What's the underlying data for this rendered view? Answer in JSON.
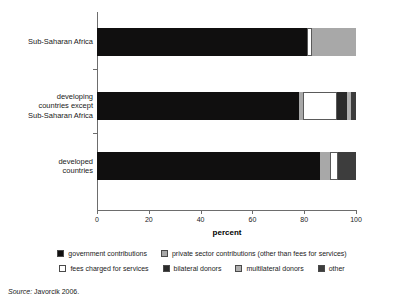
{
  "chart_data": {
    "type": "bar",
    "orientation": "horizontal",
    "stacked": true,
    "title": "",
    "xlabel": "percent",
    "ylabel": "",
    "xlim": [
      0,
      100
    ],
    "xticks": [
      0,
      20,
      40,
      60,
      80,
      100
    ],
    "xtick_labels": [
      "0",
      "20",
      "40",
      "60",
      "80",
      "100"
    ],
    "grid": false,
    "legend_position": "bottom",
    "categories": [
      "Sub-Saharan Africa",
      "developing countries except Sub-Saharan Africa",
      "developed countries"
    ],
    "category_label_lines": [
      [
        "Sub-Saharan Africa"
      ],
      [
        "developing",
        "countries except",
        "Sub-Saharan Africa"
      ],
      [
        "developed",
        "countries"
      ]
    ],
    "series": [
      {
        "name": "government contributions",
        "color": "#100f0f",
        "values": [
          81,
          78,
          86
        ]
      },
      {
        "name": "private sector contributions (other than fees for services)",
        "color": "#a8a8a8",
        "values": [
          17,
          1.5,
          4
        ]
      },
      {
        "name": "fees charged for services",
        "color": "#ffffff",
        "values": [
          2,
          13,
          3
        ]
      },
      {
        "name": "bilateral donors",
        "color": "#2b2b2b",
        "values": [
          0,
          4,
          7
        ]
      },
      {
        "name": "multilateral donors",
        "color": "#b0b0b0",
        "values": [
          0,
          1.5,
          0
        ]
      },
      {
        "name": "other",
        "color": "#3d3d3d",
        "values": [
          0,
          2,
          0
        ]
      }
    ],
    "bars": [
      {
        "category": "Sub-Saharan Africa",
        "segments": [
          {
            "name": "government contributions",
            "value": 81,
            "color": "#100f0f"
          },
          {
            "name": "fees charged for services",
            "value": 2,
            "color": "#ffffff"
          },
          {
            "name": "private sector contributions (other than fees for services)",
            "value": 17,
            "color": "#a8a8a8"
          }
        ]
      },
      {
        "category": "developing countries except Sub-Saharan Africa",
        "segments": [
          {
            "name": "government contributions",
            "value": 78,
            "color": "#100f0f"
          },
          {
            "name": "private sector contributions (other than fees for services)",
            "value": 1.5,
            "color": "#a8a8a8"
          },
          {
            "name": "fees charged for services",
            "value": 13,
            "color": "#ffffff"
          },
          {
            "name": "bilateral donors",
            "value": 4,
            "color": "#2b2b2b"
          },
          {
            "name": "multilateral donors",
            "value": 1.5,
            "color": "#b0b0b0"
          },
          {
            "name": "other",
            "value": 2,
            "color": "#3d3d3d"
          }
        ]
      },
      {
        "category": "developed countries",
        "segments": [
          {
            "name": "government contributions",
            "value": 86,
            "color": "#100f0f"
          },
          {
            "name": "private sector contributions (other than fees for services)",
            "value": 4,
            "color": "#a8a8a8"
          },
          {
            "name": "fees charged for services",
            "value": 3,
            "color": "#ffffff"
          },
          {
            "name": "bilateral donors",
            "value": 7,
            "color": "#3d3d3d"
          }
        ]
      }
    ],
    "legend": [
      {
        "label": "government contributions",
        "color": "#100f0f"
      },
      {
        "label": "private sector contributions (other than fees for services)",
        "color": "#a8a8a8"
      },
      {
        "label": "fees charged for services",
        "color": "#ffffff"
      },
      {
        "label": "bilateral donors",
        "color": "#2b2b2b"
      },
      {
        "label": "multilateral donors",
        "color": "#b0b0b0"
      },
      {
        "label": "other",
        "color": "#3d3d3d"
      }
    ]
  },
  "source": {
    "prefix": "Source:",
    "text": "Javorcik 2006."
  }
}
